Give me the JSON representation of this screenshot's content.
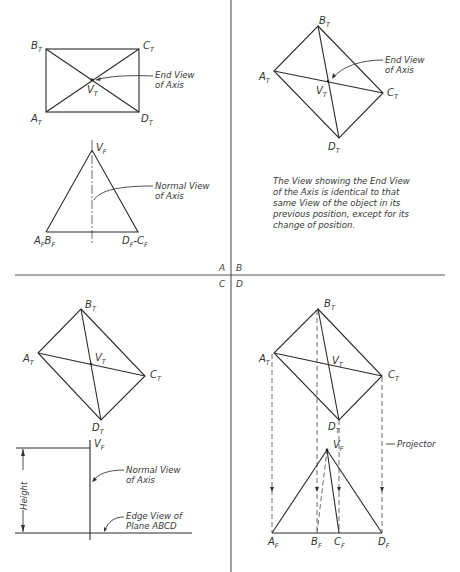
{
  "figure": {
    "quadrant_labels": [
      "A",
      "B",
      "C",
      "D"
    ],
    "panel_a": {
      "top_view_vertices": {
        "b": "B",
        "c": "C",
        "a": "A",
        "d": "D",
        "v": "V",
        "subscript": "T"
      },
      "front_view_vertices": {
        "v": "V",
        "ab": "A",
        "ab2": "B",
        "dc": "D",
        "dc2": "C",
        "subscript": "F",
        "sep": "-"
      },
      "callout_end_view": [
        "End View",
        "of Axis"
      ],
      "callout_normal_view": [
        "Normal View",
        "of Axis"
      ]
    },
    "panel_b": {
      "top_view_vertices": {
        "a": "A",
        "b": "B",
        "c": "C",
        "d": "D",
        "v": "V",
        "subscript": "T"
      },
      "callout_end_view": [
        "End View",
        "of Axis"
      ],
      "note_lines": [
        "The View showing the End View",
        "of the Axis is identical to that",
        "same View of the object in its",
        "previous position, except for its",
        "change of position."
      ]
    },
    "panel_c": {
      "top_view_vertices": {
        "a": "A",
        "b": "B",
        "c": "C",
        "d": "D",
        "v": "V",
        "subscript": "T"
      },
      "front_v": "V",
      "front_sub": "F",
      "dimension_label": "Height",
      "callout_normal_view": [
        "Normal View",
        "of Axis"
      ],
      "callout_edge_view": [
        "Edge View of",
        "Plane ABCD"
      ]
    },
    "panel_d": {
      "top_view_vertices": {
        "a": "A",
        "b": "B",
        "c": "C",
        "d": "D",
        "v": "V",
        "subscript": "T"
      },
      "front_view_vertices": {
        "a": "A",
        "b": "B",
        "c": "C",
        "d": "D",
        "v": "V",
        "subscript": "F"
      },
      "callout_projector": "Projector"
    }
  }
}
